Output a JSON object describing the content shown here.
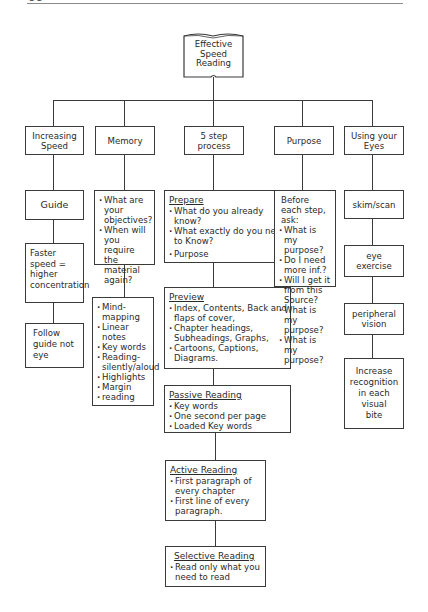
{
  "page_header": {
    "page_number": "58",
    "running_title": "SPEED READING"
  },
  "root": {
    "label": "Effective\nSpeed\nReading",
    "shape": "open-book"
  },
  "branches": [
    {
      "label": "Increasing\nSpeed",
      "children": [
        {
          "label": "Guide"
        },
        {
          "label": "Faster\nspeed =\nhigher\nconcentration"
        },
        {
          "label": "Follow\nguide not\neye"
        }
      ]
    },
    {
      "label": "Memory",
      "children": [
        {
          "items": [
            "What are your objectives?",
            "When will you require the material again?"
          ]
        },
        {
          "items": [
            "Mind-mapping",
            "Linear notes",
            "Key words",
            "Reading-silently/aloud",
            "Highlights",
            "Margin",
            "reading"
          ]
        }
      ]
    },
    {
      "label": "5 step\nprocess",
      "children": [
        {
          "heading": "Prepare",
          "items": [
            "What do you already know?",
            "What exactly do you need to Know?",
            "Purpose"
          ]
        },
        {
          "heading": "Preview",
          "items": [
            "Index, Contents, Back and flaps of cover,",
            "Chapter headings, Subheadings, Graphs,",
            "Cartoons, Captions, Diagrams."
          ]
        },
        {
          "heading": "Passive Reading",
          "items": [
            "Key words",
            "One second per page",
            "Loaded Key words"
          ]
        },
        {
          "heading": "Active Reading",
          "items": [
            "First paragraph of every chapter",
            "First line of every paragraph."
          ]
        },
        {
          "heading": "Selective Reading",
          "items": [
            "Read only what you need to read"
          ]
        }
      ]
    },
    {
      "label": "Purpose",
      "children": [
        {
          "intro": "Before each step, ask:",
          "items": [
            "What is my purpose?",
            "Do I need more inf.?",
            "Will I get it from this Source?",
            "What is my purpose?",
            "What is my purpose?"
          ]
        }
      ]
    },
    {
      "label": "Using your\nEyes",
      "children": [
        {
          "label": "skim/scan"
        },
        {
          "label": "eye\nexercise"
        },
        {
          "label": "peripheral\nvision"
        },
        {
          "label": "Increase\nrecognition\nin each\nvisual\nbite"
        }
      ]
    }
  ]
}
